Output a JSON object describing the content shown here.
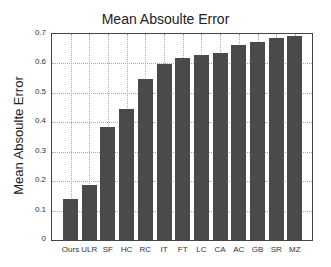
{
  "chart_data": {
    "type": "bar",
    "title": "Mean Absoulte Error",
    "xlabel": "",
    "ylabel": "Mean Absoulte Error",
    "categories": [
      "Ours",
      "ULR",
      "SF",
      "HC",
      "RC",
      "IT",
      "FT",
      "LC",
      "CA",
      "AC",
      "GB",
      "SR",
      "MZ"
    ],
    "values": [
      0.138,
      0.187,
      0.383,
      0.445,
      0.546,
      0.598,
      0.618,
      0.628,
      0.637,
      0.664,
      0.673,
      0.688,
      0.693
    ],
    "ylim": [
      0,
      0.7
    ],
    "yticks": [
      "0",
      "0.1",
      "0.2",
      "0.3",
      "0.4",
      "0.5",
      "0.6",
      "0.7"
    ],
    "grid": true,
    "bar_color": "#4a4a4a"
  }
}
